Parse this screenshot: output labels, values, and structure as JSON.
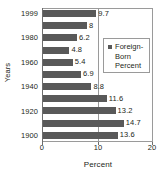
{
  "chart_data": {
    "type": "bar",
    "orientation": "horizontal",
    "title": "",
    "xlabel": "Percent",
    "ylabel": "Years",
    "xlim": [
      0,
      20
    ],
    "xticks": [
      "0",
      "10",
      "20"
    ],
    "grid": true,
    "legend": {
      "position": "inside-right",
      "entries": [
        "Foreign-",
        "Born",
        "Percent"
      ],
      "marker_color": "#595959"
    },
    "categories": [
      "1999",
      "1990",
      "1980",
      "1970",
      "1960",
      "1950",
      "1940",
      "1930",
      "1920",
      "1910",
      "1900"
    ],
    "visible_tick_labels": [
      "1999",
      "1980",
      "1960",
      "1940",
      "1920",
      "1900"
    ],
    "values": [
      9.7,
      8,
      6.2,
      4.8,
      5.4,
      6.9,
      8.8,
      11.6,
      13.2,
      14.7,
      13.6
    ],
    "value_labels": [
      "9.7",
      "8",
      "6.2",
      "4.8",
      "5.4",
      "6.9",
      "8.8",
      "11.6",
      "13.2",
      "14.7",
      "13.6"
    ],
    "bar_color": "#595959",
    "series": [
      {
        "name": "Foreign-Born Percent",
        "values": [
          9.7,
          8,
          6.2,
          4.8,
          5.4,
          6.9,
          8.8,
          11.6,
          13.2,
          14.7,
          13.6
        ]
      }
    ]
  }
}
